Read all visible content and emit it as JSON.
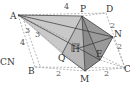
{
  "figure": {
    "type": "3d-geometry-pyramid",
    "cut_text": "CN",
    "points": {
      "A": {
        "label": "A",
        "x": 18,
        "y": 15
      },
      "P": {
        "label": "P",
        "x": 82,
        "y": 16
      },
      "D": {
        "label": "D",
        "x": 106,
        "y": 13
      },
      "N": {
        "label": "N",
        "x": 113,
        "y": 37
      },
      "C": {
        "label": "C",
        "x": 125,
        "y": 68
      },
      "E": {
        "label": "E",
        "x": 100,
        "y": 60
      },
      "M": {
        "label": "M",
        "x": 85,
        "y": 71
      },
      "B": {
        "label": "B",
        "x": 35,
        "y": 67
      },
      "Q": {
        "label": "Q",
        "x": 62,
        "y": 54
      },
      "H": {
        "label": "H",
        "x": 76,
        "y": 49
      }
    },
    "measure_labels": [
      {
        "text": "4",
        "x": 66,
        "y": 8,
        "note": "AD"
      },
      {
        "text": "4",
        "x": 20,
        "y": 44,
        "note": "AB"
      },
      {
        "text": "3",
        "x": 27,
        "y": 33
      },
      {
        "text": "3",
        "x": 38,
        "y": 36
      },
      {
        "text": "2",
        "x": 111,
        "y": 26,
        "note": "DN"
      },
      {
        "text": "2",
        "x": 119,
        "y": 49,
        "note": "NC"
      },
      {
        "text": "2",
        "x": 58,
        "y": 75,
        "note": "BM"
      },
      {
        "text": "2",
        "x": 106,
        "y": 74,
        "note": "MC"
      }
    ],
    "colors": {
      "shade_dark": "#8a8a8a",
      "shade_light": "#c8c8c8",
      "shade_mid": "#a8a8a8",
      "solid_line": "#333333",
      "dashed_line": "#9a9a9a"
    }
  }
}
